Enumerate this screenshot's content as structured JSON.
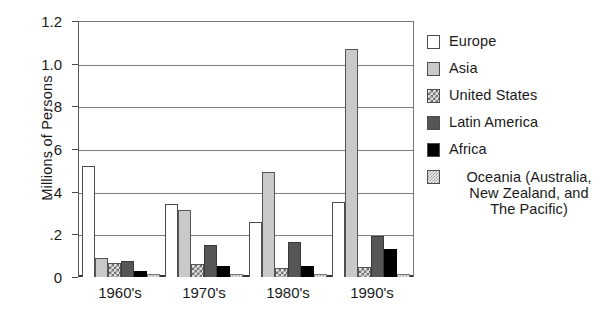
{
  "chart_data": {
    "type": "bar",
    "title": "",
    "subtitle": "",
    "xlabel": "",
    "ylabel": "Millions of Persons",
    "categories": [
      "1960's",
      "1970's",
      "1980's",
      "1990's"
    ],
    "ylim": [
      0,
      1.2
    ],
    "yticks": [
      0,
      0.2,
      0.4,
      0.6,
      0.8,
      1.0,
      1.2
    ],
    "ytick_labels": [
      "0",
      ".2",
      ".4",
      ".6",
      ".8",
      "1.0",
      "1.2"
    ],
    "grid": true,
    "legend_position": "right",
    "series": [
      {
        "name": "Europe",
        "key": "europe",
        "color": "#ffffff",
        "pattern": "solid",
        "values": [
          0.52,
          0.34,
          0.26,
          0.35
        ]
      },
      {
        "name": "Asia",
        "key": "asia",
        "color": "#c9c9c9",
        "pattern": "solid",
        "values": [
          0.09,
          0.315,
          0.49,
          1.07
        ]
      },
      {
        "name": "United States",
        "key": "us",
        "color": "#e2e2e2",
        "pattern": "checker",
        "values": [
          0.065,
          0.06,
          0.04,
          0.045
        ]
      },
      {
        "name": "Latin America",
        "key": "latin",
        "color": "#565656",
        "pattern": "solid",
        "values": [
          0.075,
          0.15,
          0.165,
          0.19
        ]
      },
      {
        "name": "Africa",
        "key": "africa",
        "color": "#000000",
        "pattern": "solid",
        "values": [
          0.03,
          0.05,
          0.05,
          0.13
        ]
      },
      {
        "name": "Oceania (Australia, New Zealand, and The Pacific)",
        "key": "oceania",
        "color": "#f0f0f0",
        "pattern": "dotted",
        "values": [
          0.012,
          0.015,
          0.015,
          0.015
        ]
      }
    ]
  },
  "legend": {
    "items": [
      {
        "label": "Europe"
      },
      {
        "label": "Asia"
      },
      {
        "label": "United States"
      },
      {
        "label": "Latin America"
      },
      {
        "label": "Africa"
      },
      {
        "label_line1": "Oceania (Australia,",
        "label_line2": "New Zealand, and",
        "label_line3": "The Pacific)"
      }
    ]
  }
}
